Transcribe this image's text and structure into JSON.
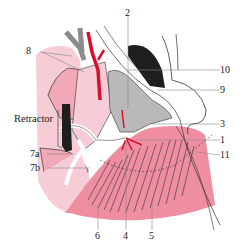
{
  "figure": {
    "type": "anatomical-surgical-illustration",
    "colors": {
      "skin_light": "#f6cdd6",
      "skin_mid": "#f2a9b7",
      "muscle": "#ee8ea0",
      "artery": "#d8102c",
      "gray_tissue": "#b9b9bb",
      "dark_gray": "#8c8c8f",
      "black": "#1e1e1e",
      "outline": "#333333",
      "leader": "#888888"
    },
    "labels": {
      "l2": "2",
      "l8": "8",
      "l10": "10",
      "l9": "9",
      "retractor": "Retractor",
      "l3": "3",
      "l1": "1",
      "l11": "11",
      "l7a": "7a",
      "l7b": "7b",
      "l6": "6",
      "l4": "4",
      "l5": "5"
    }
  }
}
